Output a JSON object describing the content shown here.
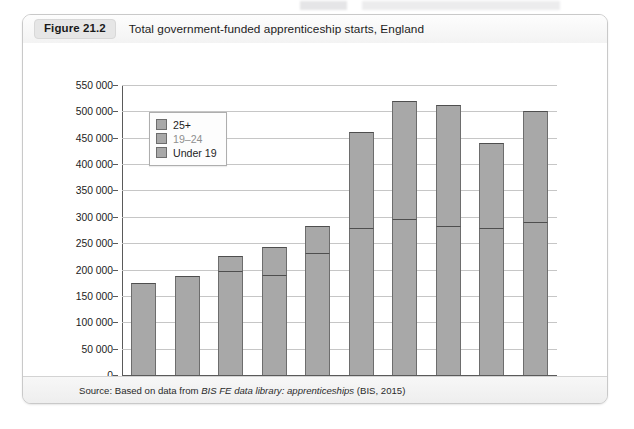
{
  "figure": {
    "tag": "Figure 21.2",
    "title": "Total government-funded apprenticeship starts, England",
    "source_prefix": "Source: Based on data from ",
    "source_italic": "BIS FE data library: apprenticeships",
    "source_suffix": " (BIS, 2015)"
  },
  "legend": {
    "items": [
      {
        "label": "25+",
        "color": "#a8a8a8"
      },
      {
        "label": "19–24",
        "color": "#a8a8a8"
      },
      {
        "label": "Under 19",
        "color": "#a8a8a8"
      }
    ]
  },
  "colors": {
    "bar_fill": "#a8a8a8",
    "bar_stroke": "#6d6d6d",
    "gridline": "#c6c6c6",
    "axis": "#5a5a5a",
    "panel_bg": "#fbfbfb",
    "header_bg": "#f3f3f3"
  },
  "chart_data": {
    "type": "bar",
    "title": "Total government-funded apprenticeship starts, England",
    "subtitle": "",
    "xlabel": "",
    "ylabel": "",
    "stacked": true,
    "grid": true,
    "legend_position": "top-left inside plot",
    "ylim": [
      0,
      550000
    ],
    "ytick_step": 50000,
    "ytick_labels": [
      "0",
      "50 000",
      "100 000",
      "150 000",
      "200 000",
      "250 000",
      "300 000",
      "350 000",
      "400 000",
      "450 000",
      "500 000",
      "550 000"
    ],
    "ytick_values": [
      0,
      50000,
      100000,
      150000,
      200000,
      250000,
      300000,
      350000,
      400000,
      450000,
      500000,
      550000
    ],
    "categories": [
      "2005/6",
      "2006/7",
      "2007/8",
      "2008/9",
      "2009/0",
      "2010/1",
      "2011/2",
      "2012/3",
      "2013/4",
      "2014/5"
    ],
    "series": [
      {
        "name": "Under 19",
        "values": [
          102000,
          105000,
          108000,
          100000,
          117000,
          132000,
          130000,
          119000,
          120000,
          128000
        ]
      },
      {
        "name": "19–24",
        "values": [
          73000,
          82000,
          90000,
          90000,
          115000,
          146000,
          165000,
          163000,
          159000,
          163000
        ]
      },
      {
        "name": "25+",
        "values": [
          0,
          0,
          27000,
          52000,
          50000,
          182000,
          225000,
          230000,
          161000,
          209000
        ]
      }
    ],
    "totals": [
      175000,
      187000,
      225000,
      242000,
      282000,
      460000,
      520000,
      512000,
      440000,
      500000
    ]
  }
}
